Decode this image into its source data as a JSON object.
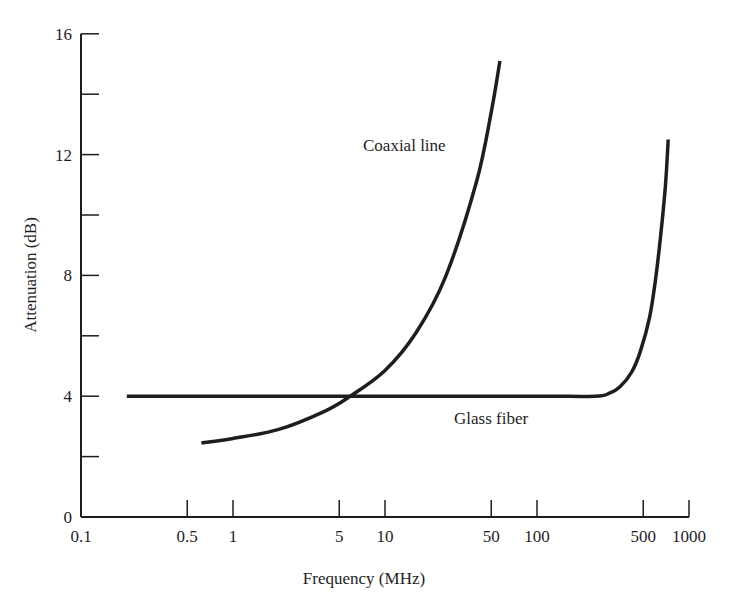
{
  "chart_data": {
    "type": "line",
    "title": "",
    "xlabel": "Frequency (MHz)",
    "ylabel": "Attenuation (dB)",
    "xscale": "log",
    "xlim": [
      0.1,
      1000
    ],
    "ylim": [
      0,
      16
    ],
    "grid": false,
    "legend": "none (curves labeled inline)",
    "x_ticks": [
      0.1,
      0.5,
      1,
      5,
      10,
      50,
      100,
      500,
      1000
    ],
    "x_tick_labels": [
      "0.1",
      "0.5",
      "1",
      "5",
      "10",
      "50",
      "100",
      "500",
      "1000"
    ],
    "y_ticks": [
      0,
      2,
      4,
      6,
      8,
      10,
      12,
      14,
      16
    ],
    "y_tick_labels": [
      "0",
      "",
      "4",
      "",
      "8",
      "",
      "12",
      "",
      "16"
    ],
    "series": [
      {
        "name": "Coaxial line",
        "x": [
          0.62,
          1.0,
          2.0,
          4.0,
          5.9,
          10,
          16,
          25,
          40,
          50,
          57
        ],
        "y": [
          2.45,
          2.6,
          2.9,
          3.5,
          4.0,
          4.85,
          6.1,
          7.95,
          11.1,
          13.4,
          15.1
        ]
      },
      {
        "name": "Glass fiber",
        "x": [
          0.2,
          1,
          10,
          100,
          240,
          300,
          350,
          420,
          480,
          550,
          600,
          650,
          700,
          730
        ],
        "y": [
          4.0,
          4.0,
          4.0,
          4.0,
          4.0,
          4.1,
          4.3,
          4.8,
          5.5,
          6.6,
          7.8,
          9.3,
          11.0,
          12.5
        ]
      }
    ],
    "annotations": [
      {
        "text": "Coaxial line",
        "near_x": 20,
        "near_y": 12.2
      },
      {
        "text": "Glass fiber",
        "near_x": 300,
        "near_y": 3.3
      }
    ]
  },
  "labels": {
    "xlabel": "Frequency (MHz)",
    "ylabel": "Attenuation (dB)",
    "coax": "Coaxial line",
    "fiber": "Glass fiber"
  },
  "colors": {
    "ink": "#1e1e1e",
    "background": "#ffffff"
  }
}
